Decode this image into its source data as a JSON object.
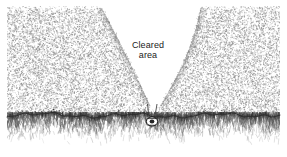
{
  "figure": {
    "kind": "technical-line-illustration",
    "width": 287,
    "height": 157,
    "background_color": "#ffffff"
  },
  "labels": {
    "cleared_area_line1": "Cleared",
    "cleared_area_line2": "area"
  },
  "scene": {
    "stipple_field": {
      "name": "dense-stippled-vegetation",
      "color": "#8a8a8a",
      "region": {
        "x": 7,
        "y": 6,
        "width": 273,
        "height": 112
      }
    },
    "cleared_cone": {
      "name": "cleared-area-cone",
      "shape": "inverted-triangle",
      "fill_color": "#ffffff",
      "apex": {
        "x": 152,
        "y": 110
      },
      "top_left": {
        "x": 100,
        "y": 20
      },
      "top_right": {
        "x": 201,
        "y": 22
      }
    },
    "ground_line": {
      "name": "ground-contour-line",
      "color": "#2b2b2b",
      "y_center": 116
    },
    "grass_band": {
      "name": "grass-tuft-band",
      "color": "#555555",
      "y_top": 116,
      "y_bottom": 146
    },
    "nozzle": {
      "name": "spray-nozzle-head",
      "color": "#1a1a1a",
      "x": 152,
      "y": 120
    },
    "spray_lines": {
      "name": "spray-jet-lines",
      "color": "#333333",
      "count": 2
    }
  },
  "colors": {
    "ink": "#1a1a1a",
    "stipple": "#8a8a8a",
    "grass": "#555555",
    "paper": "#ffffff"
  }
}
